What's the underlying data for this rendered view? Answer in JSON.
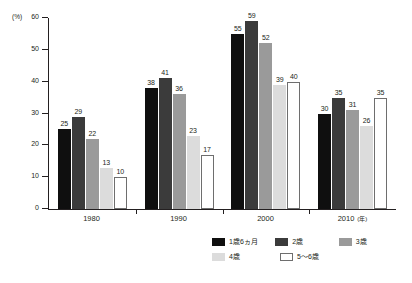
{
  "chart_data": {
    "type": "bar",
    "title": "",
    "subtitle": "",
    "xlabel": "",
    "ylabel": "",
    "y_unit": "(%)",
    "x_unit": "(年)",
    "categories": [
      "1980",
      "1990",
      "2000",
      "2010"
    ],
    "ylim": [
      0,
      60
    ],
    "yticks": [
      0,
      10,
      20,
      30,
      40,
      50,
      60
    ],
    "ytick_labels": [
      "0",
      "10",
      "20",
      "30",
      "40",
      "50",
      "60"
    ],
    "grid": false,
    "legend_position": "bottom-right",
    "series": [
      {
        "name": "1歳6ヵ月",
        "color": "#0f0f0f",
        "values": [
          25,
          38,
          55,
          30
        ]
      },
      {
        "name": "2歳",
        "color": "#3b3b3b",
        "values": [
          29,
          41,
          59,
          35
        ]
      },
      {
        "name": "3歳",
        "color": "#9a9a9a",
        "values": [
          22,
          36,
          52,
          31
        ]
      },
      {
        "name": "4歳",
        "color": "#dcdcdc",
        "values": [
          13,
          23,
          39,
          26
        ]
      },
      {
        "name": "5〜6歳",
        "color": "#ffffff",
        "values": [
          10,
          17,
          40,
          35
        ]
      }
    ]
  }
}
